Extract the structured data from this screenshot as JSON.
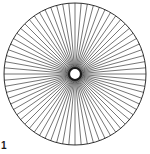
{
  "figure": {
    "type": "radial-star",
    "label": "1",
    "spoke_count": 72,
    "center": [
      75,
      74
    ],
    "outer_radius": 71,
    "inner_radius": 5,
    "stroke_color": "#1a1a1a",
    "background": "#ffffff"
  }
}
